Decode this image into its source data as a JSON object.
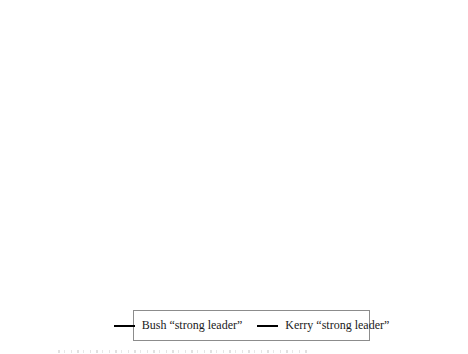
{
  "chart_data": {
    "type": "line",
    "title": "",
    "grid": "off",
    "legend_position": "bottom-center",
    "x_axis": {
      "tick_interval": "weekly",
      "start_date": "7/5/2004",
      "end_date": "11/1/2004",
      "tick_labels": [
        "7/5/2004",
        "7/12/2004",
        "7/19/2004",
        "7/26/2004",
        "8/2/2004",
        "8/9/2004",
        "8/16/2004",
        "8/23/2004",
        "8/30/2004",
        "9/6/2004",
        "9/13/2004",
        "9/20/2004",
        "9/27/2004",
        "10/4/2004",
        "10/11/2004",
        "10/18/2004",
        "10/25/2004",
        "11/1/2004"
      ]
    },
    "y_axis": {
      "range": [
        4,
        7
      ],
      "ticks": [
        {
          "label": "7",
          "value": 7
        },
        {
          "label": "6.5",
          "value": 6.5
        },
        {
          "label": "6",
          "value": 6
        },
        {
          "label": "5.5",
          "value": 5.5
        },
        {
          "label": "5",
          "value": 5
        },
        {
          "label": "4.5",
          "value": 4.5
        },
        {
          "label": "4",
          "value": 4
        }
      ]
    },
    "x_unit": "days since 7/5/2004 (daily values, index = day)",
    "series": [
      {
        "name": "Bush “strong leader”",
        "color": "#1b1b1b",
        "stroke_width": 2.2,
        "data_name": "bush-line",
        "values": [
          6.12,
          6.1,
          6.07,
          6.04,
          6.0,
          5.96,
          5.95,
          5.95,
          5.89,
          5.84,
          5.83,
          5.9,
          5.95,
          5.94,
          5.94,
          5.97,
          6.03,
          6.08,
          6.11,
          6.1,
          6.06,
          6.0,
          5.96,
          5.9,
          5.89,
          5.9,
          5.92,
          6.0,
          6.05,
          6.02,
          5.91,
          5.88,
          5.88,
          5.92,
          5.96,
          6.0,
          5.99,
          5.96,
          6.0,
          5.93,
          5.91,
          5.92,
          5.88,
          5.96,
          5.89,
          5.95,
          6.02,
          6.05,
          6.1,
          6.22,
          6.2,
          6.14,
          6.07,
          6.03,
          5.98,
          5.94,
          5.88,
          5.83,
          5.87,
          5.94,
          5.96,
          5.97,
          6.08,
          6.24,
          6.36,
          6.44,
          6.51,
          6.52,
          6.44,
          6.38,
          6.3,
          6.21,
          6.17,
          6.15,
          6.14,
          6.15,
          6.18,
          6.2,
          6.12,
          6.14,
          6.16,
          6.17,
          6.2,
          6.23,
          6.24,
          6.22,
          6.15,
          6.08,
          6.03,
          6.0,
          6.06,
          6.13,
          6.18,
          6.25,
          6.23,
          6.24,
          6.21,
          6.23,
          6.37,
          6.36,
          6.35,
          6.32,
          6.33,
          6.31,
          6.27,
          6.24,
          6.28,
          6.25,
          6.2,
          6.12,
          6.07,
          6.04,
          6.1,
          6.15,
          6.19,
          6.22,
          6.18,
          6.17,
          6.2,
          6.18,
          6.22,
          6.24,
          6.27,
          6.31,
          6.3,
          6.29,
          6.31
        ]
      },
      {
        "name": "Kerry “strong leader”",
        "color": "#bbbbbb",
        "stroke_width": 1.8,
        "data_name": "kerry-line",
        "values": [
          4.95,
          5.0,
          5.09,
          5.16,
          5.22,
          5.29,
          5.32,
          5.38,
          5.43,
          5.48,
          5.52,
          5.56,
          5.49,
          5.45,
          5.46,
          5.41,
          5.35,
          5.42,
          5.47,
          5.53,
          5.61,
          5.66,
          5.6,
          5.57,
          5.58,
          5.54,
          5.57,
          5.61,
          5.64,
          5.63,
          5.68,
          5.79,
          5.74,
          5.74,
          5.75,
          5.71,
          5.66,
          5.61,
          5.55,
          5.52,
          5.51,
          5.49,
          5.48,
          5.48,
          5.47,
          5.46,
          5.5,
          5.47,
          5.44,
          5.4,
          5.35,
          5.3,
          5.27,
          5.26,
          5.27,
          5.31,
          5.42,
          5.33,
          5.38,
          5.41,
          5.44,
          5.45,
          5.43,
          5.36,
          5.22,
          5.12,
          5.0,
          4.95,
          4.94,
          5.0,
          5.05,
          5.09,
          5.12,
          5.15,
          5.15,
          5.13,
          5.11,
          5.06,
          5.01,
          5.02,
          5.01,
          5.02,
          5.01,
          5.05,
          5.07,
          5.05,
          5.01,
          5.05,
          5.1,
          5.17,
          5.23,
          5.31,
          5.38,
          5.36,
          5.34,
          5.32,
          5.23,
          5.15,
          5.17,
          5.2,
          5.22,
          5.24,
          5.26,
          5.28,
          5.31,
          5.32,
          5.38,
          5.42,
          5.46,
          5.5,
          5.54,
          5.36,
          5.38,
          5.34,
          5.28,
          5.21,
          5.26,
          5.31,
          5.26,
          5.22,
          5.26,
          5.32,
          5.34,
          5.32,
          5.33,
          5.34,
          5.34
        ]
      }
    ]
  }
}
